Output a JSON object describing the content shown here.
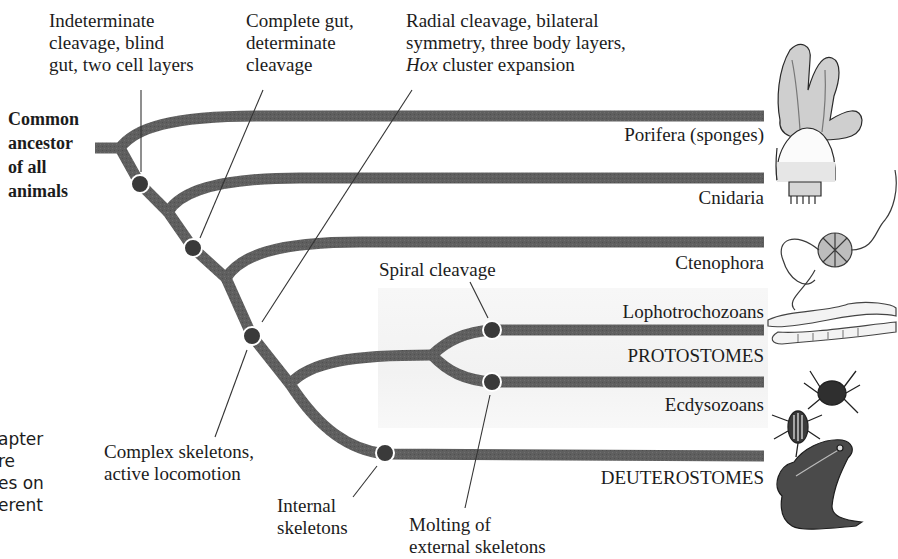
{
  "root_label": [
    "Common",
    "ancestor",
    "of all",
    "animals"
  ],
  "characters": {
    "indeterminate": [
      "Indeterminate",
      "cleavage, blind",
      "gut, two cell layers"
    ],
    "complete_gut": [
      "Complete gut,",
      "determinate",
      "cleavage"
    ],
    "radial": [
      "Radial cleavage, bilateral",
      "symmetry, three body layers,",
      "Hox",
      " cluster expansion"
    ],
    "spiral": "Spiral cleavage",
    "complex_skeletons": [
      "Complex skeletons,",
      "active locomotion"
    ],
    "internal_skeletons": [
      "Internal",
      "skeletons"
    ],
    "molting": [
      "Molting of",
      "external skeletons"
    ]
  },
  "taxa": {
    "porifera": "Porifera (sponges)",
    "cnidaria": "Cnidaria",
    "ctenophora": "Ctenophora",
    "lophotrochozoans": "Lophotrochozoans",
    "protostomes": "PROTOSTOMES",
    "ecdysozoans": "Ecdysozoans",
    "deuterostomes": "DEUTEROSTOMES"
  },
  "clipped_side_text": [
    "apter",
    "re",
    "es on",
    "erent"
  ],
  "illustrations": [
    "sponge",
    "jellyfish",
    "comb-jelly",
    "worms",
    "spider-and-beetle",
    "frog"
  ],
  "colors": {
    "branch": "#5e5e5e",
    "node": "#3a3a3a",
    "shade": "#f3f3f3",
    "text": "#1c1c1c"
  }
}
